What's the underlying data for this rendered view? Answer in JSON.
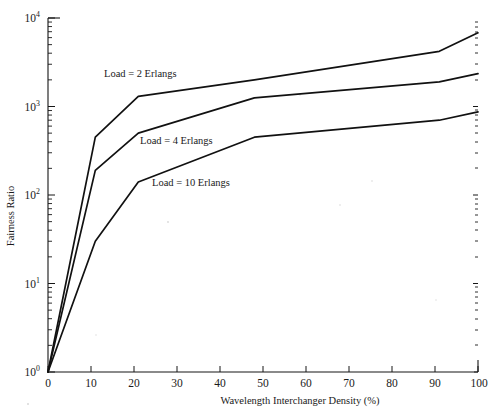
{
  "figure": {
    "background_color": "#ffffff",
    "line_color": "#111111"
  },
  "axes": {
    "x": {
      "label": "Wavelength Interchanger Density (%)",
      "tick_labels": [
        "0",
        "10",
        "20",
        "30",
        "40",
        "50",
        "60",
        "70",
        "80",
        "90",
        "100"
      ],
      "range": [
        0,
        100
      ]
    },
    "y": {
      "label": "Fairness Ratio",
      "tick_labels": [
        "10",
        "10",
        "10",
        "10",
        "10"
      ],
      "tick_exponents": [
        "0",
        "1",
        "2",
        "3",
        "4"
      ],
      "scale": "log",
      "range": [
        1,
        10000
      ]
    }
  },
  "annotations": [
    {
      "text": "Load = 2 Erlangs"
    },
    {
      "text": "Load = 4 Erlangs"
    },
    {
      "text": "Load = 10 Erlangs"
    }
  ],
  "chart_data": {
    "type": "line",
    "title": "",
    "xlabel": "Wavelength Interchanger Density (%)",
    "ylabel": "Fairness Ratio",
    "xlim": [
      0,
      100
    ],
    "ylim": [
      1,
      10000
    ],
    "yscale": "log",
    "xscale": "linear",
    "grid": false,
    "legend": "inline-annotations",
    "series": [
      {
        "name": "Load = 2 Erlangs",
        "x": [
          0,
          11,
          21,
          48,
          91,
          100
        ],
        "y": [
          1,
          450,
          1300,
          2000,
          4200,
          6800
        ]
      },
      {
        "name": "Load = 4 Erlangs",
        "x": [
          0,
          11,
          21,
          48,
          91,
          100
        ],
        "y": [
          1,
          190,
          500,
          1250,
          1900,
          2350
        ]
      },
      {
        "name": "Load = 10 Erlangs",
        "x": [
          0,
          11,
          21,
          48,
          91,
          100
        ],
        "y": [
          1,
          30,
          140,
          450,
          700,
          870
        ]
      }
    ]
  }
}
